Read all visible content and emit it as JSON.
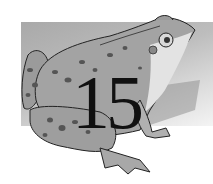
{
  "illustration": {
    "subject": "frog",
    "number_label": "15",
    "colors": {
      "background_rect": "#b5b5b5",
      "frog_body": "#9a9a9a",
      "frog_belly": "#e6e6e6",
      "spots": "#555555",
      "outline": "#222222",
      "number": "#111111"
    }
  }
}
